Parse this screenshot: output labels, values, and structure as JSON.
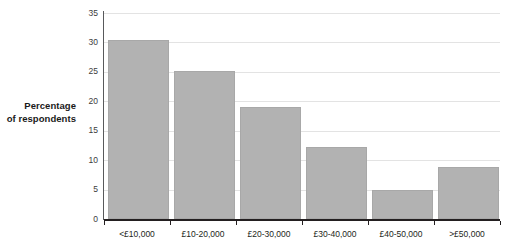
{
  "chart_data": {
    "type": "bar",
    "title": "",
    "subtitle": "",
    "xlabel": "",
    "ylabel": "Percentage of respondents",
    "ylabel_lines": [
      "Percentage",
      "of respondents"
    ],
    "categories": [
      "<£10,000",
      "£10-20,000",
      "£20-30,000",
      "£30-40,000",
      "£40-50,000",
      ">£50,000"
    ],
    "values": [
      30.4,
      25.2,
      19.0,
      12.3,
      5.0,
      8.9
    ],
    "ylim": [
      0,
      35
    ],
    "ytick_values": [
      0,
      5,
      10,
      15,
      20,
      25,
      30,
      35
    ],
    "ytick_labels": [
      "0",
      "5",
      "10",
      "15",
      "20",
      "25",
      "30",
      "35"
    ],
    "grid": true,
    "grid_axis": "y",
    "legend": false,
    "legend_position": "none",
    "bar_color": "#b2b2b2",
    "bar_edge_color": "#a8a8a8",
    "grid_color": "#e3e3e3",
    "axis_color": "#231f20",
    "background_color": "#ffffff"
  }
}
